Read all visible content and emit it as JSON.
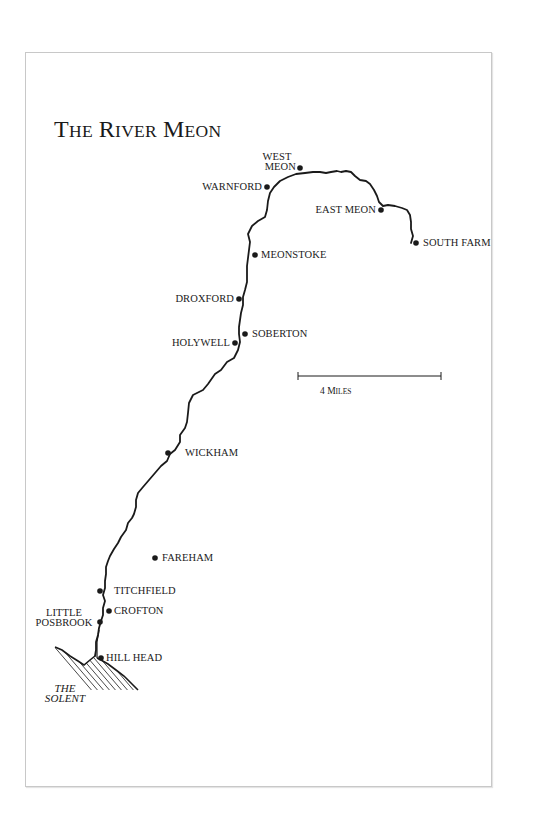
{
  "map": {
    "title": "The River Meon",
    "title_parts": [
      {
        "cap": "T",
        "rest": "HE"
      },
      {
        "cap": "R",
        "rest": "IVER"
      },
      {
        "cap": "M",
        "rest": "EON"
      }
    ],
    "scale": {
      "value": "4",
      "unit_cap": "M",
      "unit_rest": "ILES",
      "label": "4 Miles"
    },
    "places": [
      {
        "id": "west-meon",
        "line1": "WEST",
        "line2": "MEON"
      },
      {
        "id": "warnford",
        "label": "WARNFORD"
      },
      {
        "id": "east-meon",
        "label": "EAST MEON"
      },
      {
        "id": "south-farm",
        "label": "SOUTH FARM"
      },
      {
        "id": "meonstoke",
        "label": "MEONSTOKE"
      },
      {
        "id": "droxford",
        "label": "DROXFORD"
      },
      {
        "id": "soberton",
        "label": "SOBERTON"
      },
      {
        "id": "holywell",
        "label": "HOLYWELL"
      },
      {
        "id": "wickham",
        "label": "WICKHAM"
      },
      {
        "id": "fareham",
        "label": "FAREHAM"
      },
      {
        "id": "titchfield",
        "label": "TITCHFIELD"
      },
      {
        "id": "crofton",
        "label": "CROFTON"
      },
      {
        "id": "little-posbrook",
        "line1": "LITTLE",
        "line2": "POSBROOK"
      },
      {
        "id": "hill-head",
        "label": "HILL HEAD"
      }
    ],
    "water": {
      "line1": "THE",
      "line2": "SOLENT"
    },
    "colors": {
      "ink": "#1a1a1a",
      "frame": "#c8c8c8",
      "paper": "#ffffff"
    }
  }
}
